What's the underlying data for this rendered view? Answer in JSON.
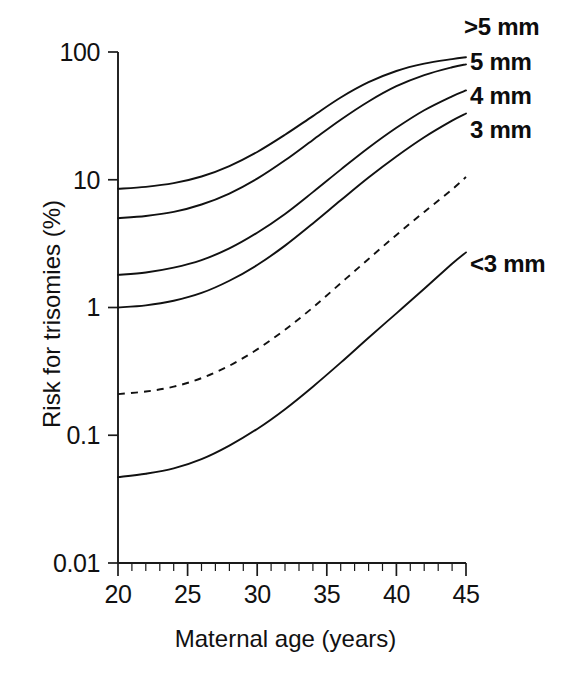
{
  "chart_data": {
    "type": "line",
    "title": "",
    "xlabel": "Maternal age (years)",
    "ylabel": "Risk for trisomies (%)",
    "xlim": [
      20,
      45
    ],
    "ylim": [
      0.01,
      100
    ],
    "yscale": "log",
    "xscale": "linear",
    "grid": false,
    "legend_position": "right-of-curves (inline end labels)",
    "xticks": [
      "20",
      "25",
      "30",
      "35",
      "40",
      "45"
    ],
    "xtick_values": [
      20,
      25,
      30,
      35,
      40,
      45
    ],
    "x_minor_tick_step": 1,
    "yticks": [
      "100",
      "10",
      "1",
      "0.1",
      "0.01"
    ],
    "ytick_values": [
      100,
      10,
      1,
      0.1,
      0.01
    ],
    "x": [
      20,
      22,
      24,
      26,
      28,
      30,
      32,
      34,
      36,
      38,
      40,
      42,
      44,
      45
    ],
    "series": [
      {
        "name": ">5 mm",
        "label": ">5 mm",
        "style": "solid",
        "color": "#111111",
        "values": [
          8.5,
          8.8,
          9.4,
          10.6,
          12.8,
          16.5,
          22.5,
          31.5,
          44.0,
          58.0,
          71.0,
          81.0,
          88.0,
          91.0
        ]
      },
      {
        "name": "5 mm",
        "label": "5 mm",
        "style": "solid",
        "color": "#111111",
        "values": [
          5.0,
          5.2,
          5.6,
          6.4,
          7.8,
          10.2,
          14.2,
          20.5,
          29.5,
          41.0,
          54.0,
          66.0,
          76.0,
          80.0
        ]
      },
      {
        "name": "4 mm",
        "label": "4 mm",
        "style": "solid",
        "color": "#111111",
        "values": [
          1.8,
          1.88,
          2.05,
          2.35,
          2.9,
          3.85,
          5.4,
          8.0,
          12.0,
          17.8,
          25.5,
          35.0,
          45.0,
          50.0
        ]
      },
      {
        "name": "3 mm",
        "label": "3 mm",
        "style": "solid",
        "color": "#111111",
        "values": [
          1.0,
          1.04,
          1.13,
          1.3,
          1.62,
          2.15,
          3.05,
          4.55,
          6.9,
          10.4,
          15.2,
          21.5,
          29.0,
          33.0
        ]
      },
      {
        "name": "intermediate-dashed",
        "label": "",
        "style": "dashed",
        "color": "#111111",
        "values": [
          0.21,
          0.22,
          0.24,
          0.28,
          0.35,
          0.47,
          0.67,
          1.0,
          1.55,
          2.4,
          3.7,
          5.6,
          8.4,
          10.5
        ]
      },
      {
        "name": "<3 mm",
        "label": "<3 mm",
        "style": "solid",
        "color": "#111111",
        "values": [
          0.047,
          0.05,
          0.055,
          0.065,
          0.083,
          0.112,
          0.16,
          0.24,
          0.37,
          0.58,
          0.9,
          1.4,
          2.2,
          2.7
        ]
      }
    ]
  },
  "axes": {
    "x_title": "Maternal age (years)",
    "y_title": "Risk for trisomies (%)",
    "x_tick_labels": [
      "20",
      "25",
      "30",
      "35",
      "40",
      "45"
    ],
    "y_tick_labels": [
      "100",
      "10",
      "1",
      "0.1",
      "0.01"
    ]
  },
  "curve_labels": {
    "gt5": ">5 mm",
    "mm5": "5 mm",
    "mm4": "4 mm",
    "mm3": "3 mm",
    "lt3": "<3 mm"
  },
  "colors": {
    "ink": "#111111",
    "background": "#ffffff"
  }
}
